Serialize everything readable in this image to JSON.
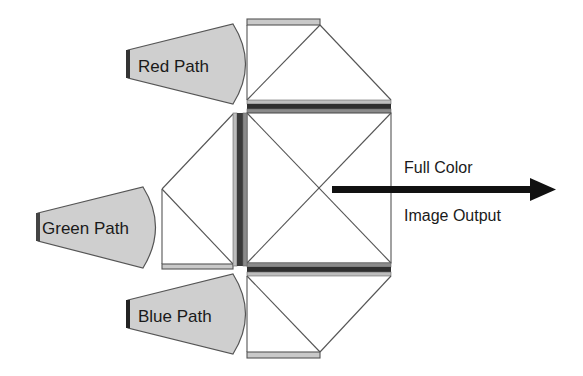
{
  "diagram": {
    "type": "optical-prism-combiner",
    "inputs": [
      {
        "id": "red",
        "label": "Red Path"
      },
      {
        "id": "green",
        "label": "Green Path"
      },
      {
        "id": "blue",
        "label": "Blue Path"
      }
    ],
    "output": {
      "line1": "Full Color",
      "line2": "Image Output"
    },
    "colors": {
      "background": "#ffffff",
      "beam_fill": "#cfcfcf",
      "beam_stroke": "#555555",
      "source_bar": "#333333",
      "prism_stroke": "#555555",
      "filter_dark": "#2e2e2e",
      "filter_mid": "#777777",
      "filter_light": "#bdbdbd",
      "arrow": "#111111"
    }
  }
}
